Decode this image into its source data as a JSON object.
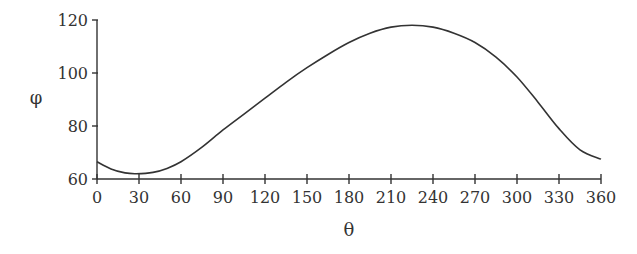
{
  "chart_data": {
    "type": "line",
    "title": "",
    "xlabel": "θ",
    "ylabel": "φ",
    "xlim": [
      0,
      360
    ],
    "ylim": [
      60,
      120
    ],
    "xticks": [
      0,
      30,
      60,
      90,
      120,
      150,
      180,
      210,
      240,
      270,
      300,
      330,
      360
    ],
    "yticks": [
      60,
      80,
      100,
      120
    ],
    "grid": false,
    "legend": null,
    "series": [
      {
        "name": "φ(θ)",
        "x": [
          0,
          10,
          20,
          28,
          40,
          50,
          60,
          75,
          90,
          105,
          120,
          135,
          150,
          165,
          180,
          195,
          210,
          225,
          240,
          255,
          270,
          285,
          300,
          315,
          330,
          345,
          360
        ],
        "values": [
          66.5,
          63.8,
          62.3,
          62,
          62.5,
          64,
          66.5,
          72,
          78.5,
          84.5,
          90.5,
          96.5,
          102,
          107,
          111.5,
          115,
          117.3,
          118,
          117.3,
          115,
          111.5,
          106,
          98.5,
          89,
          79,
          71,
          67.5
        ]
      }
    ],
    "colors": {
      "line": "#333333",
      "axis": "#333333"
    }
  }
}
